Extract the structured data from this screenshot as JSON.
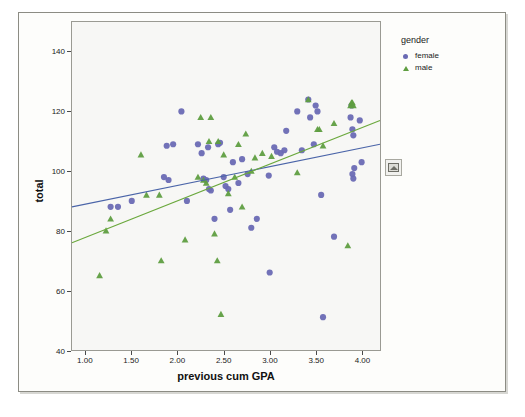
{
  "legend": {
    "title": "gender",
    "entries": [
      {
        "label": "female",
        "marker": "circle",
        "color": "#6a6ab4"
      },
      {
        "label": "male",
        "marker": "triangle",
        "color": "#5f9e41"
      }
    ]
  },
  "side_handle": {
    "icon": "chart-thumbnail-icon"
  },
  "chart_data": {
    "type": "scatter",
    "title": "",
    "xlabel": "previous cum GPA",
    "ylabel": "total",
    "xlim": [
      0.85,
      4.2
    ],
    "ylim": [
      40,
      150
    ],
    "xticks": [
      "1.00",
      "1.50",
      "2.00",
      "2.50",
      "3.00",
      "3.50",
      "4.00"
    ],
    "xtick_values": [
      1.0,
      1.5,
      2.0,
      2.5,
      3.0,
      3.5,
      4.0
    ],
    "yticks": [
      "40",
      "60",
      "80",
      "100",
      "120",
      "140"
    ],
    "ytick_values": [
      40,
      60,
      80,
      100,
      120,
      140
    ],
    "grid": false,
    "legend_position": "right",
    "series": [
      {
        "name": "female",
        "marker": "circle",
        "color": "#6a6ab4",
        "points": [
          [
            1.27,
            88
          ],
          [
            1.35,
            88
          ],
          [
            1.5,
            90
          ],
          [
            1.85,
            98
          ],
          [
            1.9,
            97
          ],
          [
            1.88,
            108.5
          ],
          [
            1.95,
            109
          ],
          [
            2.04,
            120
          ],
          [
            2.1,
            90
          ],
          [
            2.22,
            109
          ],
          [
            2.26,
            106
          ],
          [
            2.28,
            97.5
          ],
          [
            2.31,
            97
          ],
          [
            2.33,
            108
          ],
          [
            2.34,
            94
          ],
          [
            2.36,
            93.5
          ],
          [
            2.4,
            84
          ],
          [
            2.44,
            109
          ],
          [
            2.46,
            109.5
          ],
          [
            2.5,
            98
          ],
          [
            2.52,
            95
          ],
          [
            2.55,
            94
          ],
          [
            2.57,
            87
          ],
          [
            2.6,
            103
          ],
          [
            2.66,
            96
          ],
          [
            2.7,
            104
          ],
          [
            2.76,
            99
          ],
          [
            2.8,
            81
          ],
          [
            2.86,
            84
          ],
          [
            2.99,
            98.5
          ],
          [
            3.0,
            66
          ],
          [
            3.05,
            108
          ],
          [
            3.08,
            106.5
          ],
          [
            3.12,
            106
          ],
          [
            3.16,
            107
          ],
          [
            3.18,
            113.5
          ],
          [
            3.3,
            120
          ],
          [
            3.35,
            107
          ],
          [
            3.42,
            124
          ],
          [
            3.44,
            118
          ],
          [
            3.48,
            109
          ],
          [
            3.5,
            122
          ],
          [
            3.52,
            120
          ],
          [
            3.56,
            92
          ],
          [
            3.58,
            51
          ],
          [
            3.7,
            78
          ],
          [
            3.88,
            118
          ],
          [
            3.89,
            122
          ],
          [
            3.9,
            114
          ],
          [
            3.91,
            112
          ],
          [
            3.92,
            101
          ],
          [
            3.9,
            99
          ],
          [
            3.91,
            97.5
          ],
          [
            3.98,
            117
          ],
          [
            4.0,
            103
          ]
        ]
      },
      {
        "name": "male",
        "marker": "triangle",
        "color": "#5f9e41",
        "points": [
          [
            1.15,
            65
          ],
          [
            1.22,
            80
          ],
          [
            1.27,
            84
          ],
          [
            1.6,
            105.5
          ],
          [
            1.66,
            92
          ],
          [
            1.8,
            92
          ],
          [
            1.82,
            70
          ],
          [
            2.08,
            77
          ],
          [
            2.22,
            98
          ],
          [
            2.25,
            118
          ],
          [
            2.28,
            97
          ],
          [
            2.31,
            96
          ],
          [
            2.34,
            110
          ],
          [
            2.36,
            118
          ],
          [
            2.4,
            79
          ],
          [
            2.43,
            70
          ],
          [
            2.44,
            110
          ],
          [
            2.47,
            52
          ],
          [
            2.5,
            105.5
          ],
          [
            2.55,
            92.5
          ],
          [
            2.62,
            98
          ],
          [
            2.66,
            109
          ],
          [
            2.7,
            88
          ],
          [
            2.74,
            112.5
          ],
          [
            2.8,
            100
          ],
          [
            2.84,
            104.5
          ],
          [
            2.92,
            106
          ],
          [
            3.02,
            105
          ],
          [
            3.3,
            99.5
          ],
          [
            3.42,
            124
          ],
          [
            3.52,
            114
          ],
          [
            3.54,
            114
          ],
          [
            3.58,
            108.5
          ],
          [
            3.7,
            116
          ],
          [
            3.85,
            75
          ],
          [
            3.88,
            122
          ],
          [
            3.89,
            123
          ],
          [
            3.9,
            123
          ],
          [
            3.91,
            122
          ]
        ]
      }
    ],
    "fit_lines": [
      {
        "name": "female-fit",
        "color": "#4a64a8",
        "x0": 0.85,
        "y0": 88,
        "x1": 4.2,
        "y1": 109
      },
      {
        "name": "male-fit",
        "color": "#6aa83c",
        "x0": 0.85,
        "y0": 76,
        "x1": 4.2,
        "y1": 117
      }
    ]
  }
}
